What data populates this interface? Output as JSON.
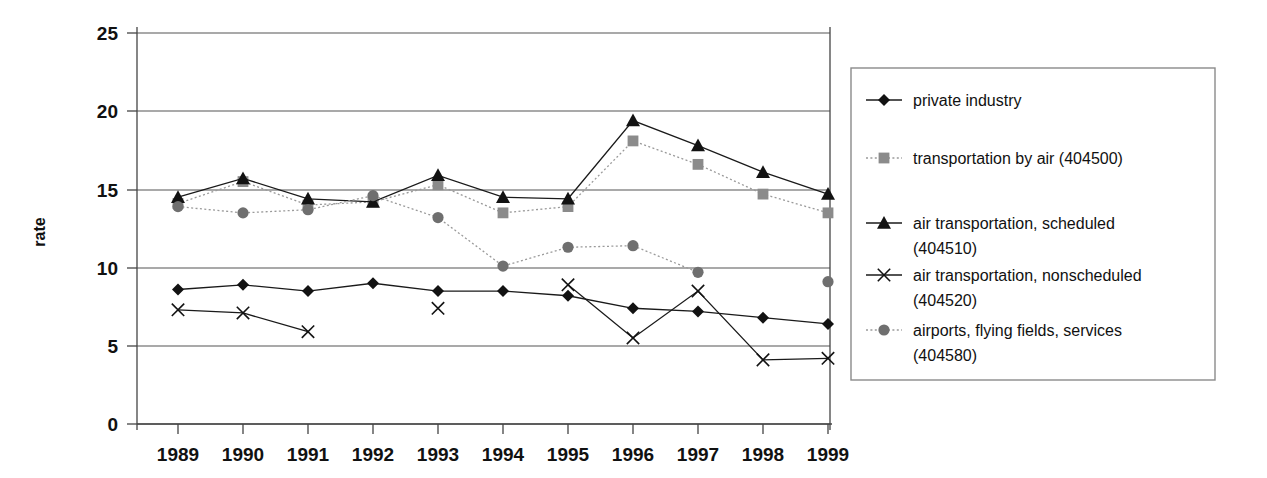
{
  "chart_data": {
    "type": "line",
    "title": "",
    "xlabel": "",
    "ylabel": "rate",
    "x": [
      "1989",
      "1990",
      "1991",
      "1992",
      "1993",
      "1994",
      "1995",
      "1996",
      "1997",
      "1998",
      "1999"
    ],
    "ylim": [
      0,
      25
    ],
    "yticks": [
      0,
      5,
      10,
      15,
      20,
      25
    ],
    "grid": true,
    "legend_position": "right",
    "series": [
      {
        "name": "private industry",
        "marker": "diamond",
        "line": "solid",
        "color": "#121212",
        "values": [
          8.6,
          8.9,
          8.5,
          9.0,
          8.5,
          8.5,
          8.2,
          7.4,
          7.2,
          6.8,
          6.4
        ]
      },
      {
        "name": "transportation by air (404500)",
        "marker": "square",
        "line": "dotted",
        "color": "#8b8b8b",
        "values": [
          14.1,
          15.5,
          14.0,
          14.2,
          15.3,
          13.5,
          13.9,
          18.1,
          16.6,
          14.7,
          13.5
        ]
      },
      {
        "name": "air transportation, scheduled (404510)",
        "marker": "triangle",
        "line": "solid",
        "color": "#121212",
        "values": [
          14.5,
          15.7,
          14.4,
          14.2,
          15.9,
          14.5,
          14.4,
          19.4,
          17.8,
          16.1,
          14.7
        ]
      },
      {
        "name": "air transportation, nonscheduled (404520)",
        "marker": "x",
        "line": "solid",
        "color": "#121212",
        "values": [
          7.3,
          7.1,
          5.9,
          null,
          7.4,
          null,
          8.9,
          5.5,
          8.5,
          4.1,
          4.2
        ]
      },
      {
        "name": "airports, flying fields, services (404580)",
        "marker": "circle",
        "line": "dotted",
        "color": "#6f6f6f",
        "values": [
          13.9,
          13.5,
          13.7,
          14.6,
          13.2,
          10.1,
          11.3,
          11.4,
          9.7,
          null,
          9.1
        ]
      }
    ]
  },
  "axis": {
    "y_label": "rate",
    "y_ticks": [
      "25",
      "20",
      "15",
      "10",
      "5",
      "0"
    ],
    "x_ticks": [
      "1989",
      "1990",
      "1991",
      "1992",
      "1993",
      "1994",
      "1995",
      "1996",
      "1997",
      "1998",
      "1999"
    ]
  },
  "legend": {
    "items": [
      {
        "label_line1": "private industry",
        "label_line2": "",
        "marker": "diamond-marker",
        "line_style": "solid"
      },
      {
        "label_line1": "transportation by air (404500)",
        "label_line2": "",
        "marker": "square-marker",
        "line_style": "dotted"
      },
      {
        "label_line1": "air transportation, scheduled",
        "label_line2": "(404510)",
        "marker": "triangle-marker",
        "line_style": "solid"
      },
      {
        "label_line1": "air transportation, nonscheduled",
        "label_line2": "(404520)",
        "marker": "x-marker",
        "line_style": "solid"
      },
      {
        "label_line1": "airports, flying fields, services",
        "label_line2": "(404580)",
        "marker": "circle-marker",
        "line_style": "dotted"
      }
    ]
  }
}
